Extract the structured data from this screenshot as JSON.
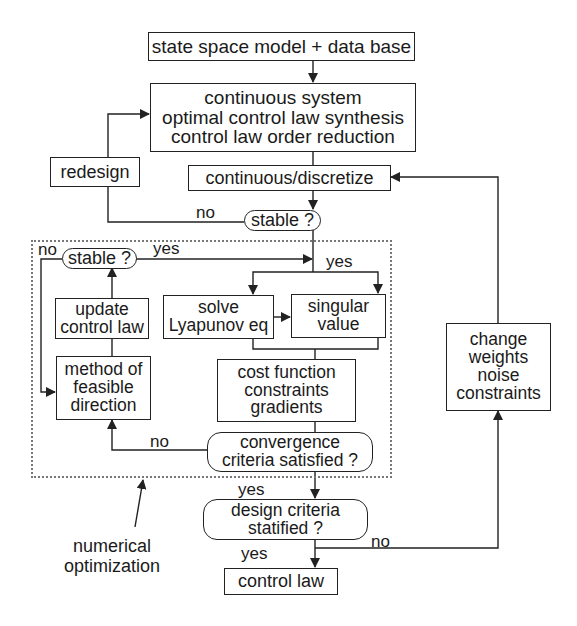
{
  "diagram": {
    "type": "flowchart",
    "nodes": {
      "model": {
        "lines": [
          "state space model + data base"
        ]
      },
      "synthesis": {
        "lines": [
          "continuous  system",
          "optimal control law synthesis",
          "control law order reduction"
        ]
      },
      "redesign": {
        "lines": [
          "redesign"
        ]
      },
      "discretize": {
        "lines": [
          "continuous/discretize"
        ]
      },
      "stable_outer": {
        "lines": [
          "stable ?"
        ]
      },
      "stable_inner": {
        "lines": [
          "stable ?"
        ]
      },
      "update": {
        "lines": [
          "update",
          "control law"
        ]
      },
      "lyapunov": {
        "lines": [
          "solve",
          "Lyapunov eq"
        ]
      },
      "singular": {
        "lines": [
          "singular",
          "value"
        ]
      },
      "feasible": {
        "lines": [
          "method of",
          "feasible",
          "direction"
        ]
      },
      "cost": {
        "lines": [
          "cost function",
          "constraints",
          "gradients"
        ]
      },
      "convergence": {
        "lines": [
          "convergence",
          "criteria satisfied ?"
        ]
      },
      "change": {
        "lines": [
          "change",
          "weights",
          "noise",
          "constraints"
        ]
      },
      "design": {
        "lines": [
          "design criteria",
          "statified ?"
        ]
      },
      "control_law": {
        "lines": [
          "control law"
        ]
      }
    },
    "edge_labels": {
      "outer_no": "no",
      "outer_yes": "yes",
      "inner_no": "no",
      "inner_yes": "yes",
      "convergence_no": "no",
      "convergence_yes": "yes",
      "design_no": "no",
      "design_yes": "yes"
    },
    "group": {
      "label_lines": [
        "numerical",
        "optimization"
      ]
    }
  }
}
